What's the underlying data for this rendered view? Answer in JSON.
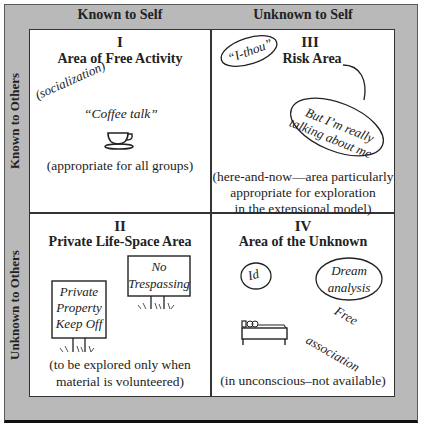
{
  "diagram": {
    "column_headers": [
      "Known to Self",
      "Unknown to Self"
    ],
    "row_headers": [
      "Known to Others",
      "Unknown to Others"
    ],
    "colors": {
      "frame": "#b9b9b9",
      "panel": "#ffffff",
      "lines": "#333333"
    },
    "quadrants": [
      {
        "numeral": "I",
        "title": "Area of Free Activity",
        "annotations": [
          "(socialization)",
          "“Coffee talk”"
        ],
        "icon": "coffee-cup-icon",
        "note": "(appropriate for all groups)"
      },
      {
        "numeral": "II",
        "title": "Private Life-Space Area",
        "signs": [
          {
            "lines": [
              "Private",
              "Property",
              "Keep Off"
            ]
          },
          {
            "lines": [
              "No",
              "Trespassing"
            ]
          }
        ],
        "note_lines": [
          "(to be explored only when",
          "material is volunteered)"
        ]
      },
      {
        "numeral": "III",
        "title": "Risk Area",
        "bubbles": [
          "“I-thou”",
          "But I’m really",
          "talking about me"
        ],
        "note_lines": [
          "(here-and-now—area particularly",
          "appropriate for exploration",
          "in the extensional model)"
        ]
      },
      {
        "numeral": "IV",
        "title": "Area of the Unknown",
        "bubbles": [
          "Id",
          "Dream",
          "analysis"
        ],
        "annotations": [
          "Free",
          "association"
        ],
        "icon": "couch-bed-icon",
        "note": "(in unconscious–not available)"
      }
    ]
  }
}
